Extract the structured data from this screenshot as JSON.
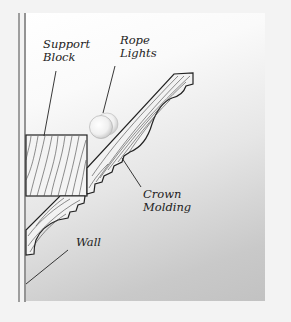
{
  "diagram": {
    "labels": {
      "support_block": [
        "Support",
        "Block"
      ],
      "rope_lights": [
        "Rope",
        "Lights"
      ],
      "crown_molding": [
        "Crown",
        "Molding"
      ],
      "wall": "Wall"
    },
    "colors": {
      "line": "#222222",
      "grain": "#555555",
      "panel_light": "#ffffff",
      "panel_dark": "#c2c2c2"
    }
  }
}
